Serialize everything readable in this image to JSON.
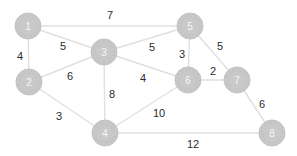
{
  "diagram": {
    "type": "weighted-undirected-graph",
    "background_color": "#ffffff",
    "node_fill_color": "#c9c9c9",
    "node_texture_color": "#bdbdbd",
    "node_label_color": "#f7f7f7",
    "edge_color": "#e0e0e0",
    "weight_label_color": "#2b2b2b",
    "node_radius": 13,
    "nodes": [
      {
        "id": "1",
        "x": 28,
        "y": 26
      },
      {
        "id": "2",
        "x": 29,
        "y": 82
      },
      {
        "id": "3",
        "x": 104,
        "y": 52
      },
      {
        "id": "4",
        "x": 105,
        "y": 133
      },
      {
        "id": "5",
        "x": 190,
        "y": 26
      },
      {
        "id": "6",
        "x": 188,
        "y": 80
      },
      {
        "id": "7",
        "x": 237,
        "y": 80
      },
      {
        "id": "8",
        "x": 272,
        "y": 133
      }
    ],
    "edges": [
      {
        "from": "1",
        "to": "5",
        "weight": "7",
        "label_x": 110,
        "label_y": 15
      },
      {
        "from": "1",
        "to": "3",
        "weight": "5",
        "label_x": 63,
        "label_y": 46
      },
      {
        "from": "1",
        "to": "2",
        "weight": "4",
        "label_x": 20,
        "label_y": 56
      },
      {
        "from": "2",
        "to": "3",
        "weight": "6",
        "label_x": 70,
        "label_y": 76
      },
      {
        "from": "3",
        "to": "5",
        "weight": "5",
        "label_x": 152,
        "label_y": 47
      },
      {
        "from": "5",
        "to": "6",
        "weight": "3",
        "label_x": 182,
        "label_y": 54
      },
      {
        "from": "5",
        "to": "7",
        "weight": "5",
        "label_x": 220,
        "label_y": 46
      },
      {
        "from": "6",
        "to": "7",
        "weight": "2",
        "label_x": 213,
        "label_y": 71
      },
      {
        "from": "3",
        "to": "6",
        "weight": "4",
        "label_x": 143,
        "label_y": 78
      },
      {
        "from": "3",
        "to": "4",
        "weight": "8",
        "label_x": 112,
        "label_y": 94
      },
      {
        "from": "2",
        "to": "4",
        "weight": "3",
        "label_x": 59,
        "label_y": 116
      },
      {
        "from": "4",
        "to": "6",
        "weight": "10",
        "label_x": 159,
        "label_y": 113
      },
      {
        "from": "7",
        "to": "8",
        "weight": "6",
        "label_x": 262,
        "label_y": 104
      },
      {
        "from": "4",
        "to": "8",
        "weight": "12",
        "label_x": 193,
        "label_y": 144
      }
    ]
  }
}
